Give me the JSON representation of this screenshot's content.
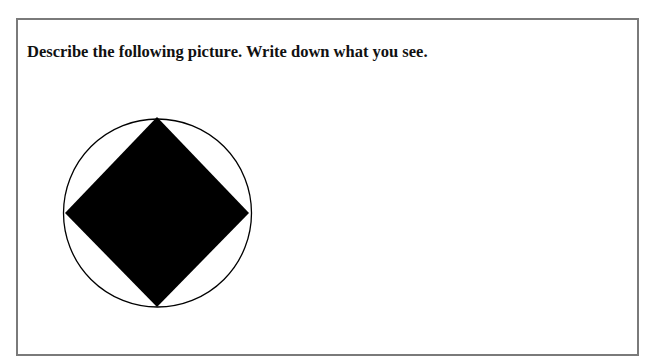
{
  "question": {
    "prompt": "Describe the following picture. Write down what you see."
  },
  "figure": {
    "shapes": [
      {
        "type": "circle",
        "fill": "none",
        "stroke": "#000000"
      },
      {
        "type": "diamond",
        "fill": "#000000"
      }
    ]
  },
  "colors": {
    "border": "#7a7a7a",
    "text": "#111111",
    "shape_fill": "#000000",
    "background": "#ffffff"
  }
}
